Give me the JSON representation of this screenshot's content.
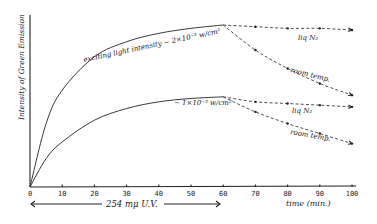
{
  "chart_data": {
    "type": "line",
    "title": "",
    "xlabel": "time (min.)",
    "ylabel": "Intensity of Green Emission",
    "xlim": [
      0,
      100
    ],
    "ylim": [
      0,
      1
    ],
    "grid": false,
    "x_ticks": [
      0,
      10,
      20,
      30,
      40,
      50,
      60,
      70,
      80,
      90,
      100
    ],
    "x_tick_labels": [
      "0",
      "10",
      "20",
      "30",
      "40",
      "50",
      "60",
      "70",
      "80",
      "90",
      "100"
    ],
    "annotations": [
      {
        "text": "exciting light intensity ~ 2×10⁻³ w/cm²",
        "near": "upper curve, x≈20–60"
      },
      {
        "text": "~ 1×10⁻³ w/cm²",
        "near": "lower curve, x≈35–60"
      },
      {
        "text": "liq N₂",
        "near": "upper flat dashed branch, x≈80"
      },
      {
        "text": "room temp.",
        "near": "upper decaying dashed branch, x≈80–90"
      },
      {
        "text": "liq N₂",
        "near": "lower flat dashed branch, x≈80"
      },
      {
        "text": "room temp.",
        "near": "lower decaying dashed branch, x≈80–90"
      },
      {
        "text": "254 mμ U.V.",
        "near": "double arrow spanning x=0 to 60 below axis"
      }
    ],
    "series": [
      {
        "name": "excitation ~2×10⁻³ w/cm² (build-up, UV on)",
        "style": "solid",
        "x": [
          0,
          5,
          10,
          20,
          30,
          40,
          50,
          60
        ],
        "values": [
          0.0,
          0.38,
          0.58,
          0.78,
          0.87,
          0.92,
          0.95,
          0.97
        ]
      },
      {
        "name": "~2×10⁻³ w/cm² — liq N₂ (UV off)",
        "style": "dashed",
        "x": [
          60,
          70,
          80,
          90,
          100
        ],
        "values": [
          0.97,
          0.96,
          0.95,
          0.95,
          0.94
        ]
      },
      {
        "name": "~2×10⁻³ w/cm² — room temp. (UV off)",
        "style": "dashed",
        "x": [
          60,
          70,
          80,
          90,
          100
        ],
        "values": [
          0.97,
          0.82,
          0.71,
          0.62,
          0.55
        ]
      },
      {
        "name": "excitation ~1×10⁻³ w/cm² (build-up, UV on)",
        "style": "solid",
        "x": [
          0,
          5,
          10,
          20,
          30,
          40,
          50,
          60
        ],
        "values": [
          0.0,
          0.17,
          0.27,
          0.4,
          0.47,
          0.51,
          0.53,
          0.54
        ]
      },
      {
        "name": "~1×10⁻³ w/cm² — liq N₂ (UV off)",
        "style": "dashed",
        "x": [
          60,
          70,
          80,
          90,
          100
        ],
        "values": [
          0.54,
          0.51,
          0.5,
          0.49,
          0.48
        ]
      },
      {
        "name": "~1×10⁻³ w/cm² — room temp. (UV off)",
        "style": "dashed",
        "x": [
          60,
          70,
          80,
          90,
          100
        ],
        "values": [
          0.54,
          0.45,
          0.38,
          0.32,
          0.26
        ]
      }
    ]
  },
  "labels": {
    "ylabel": "Intensity of Green Emission",
    "xlabel": "time (min.)",
    "uv_label": "254 mμ U.V.",
    "upper_curve": "exciting light intensity ~ 2×10⁻³ w/cm²",
    "lower_curve": "~ 1×10⁻³ w/cm²",
    "liq_n2_upper": "liq N₂",
    "room_temp_upper": "room temp.",
    "liq_n2_lower": "liq N₂",
    "room_temp_lower": "room temp."
  }
}
